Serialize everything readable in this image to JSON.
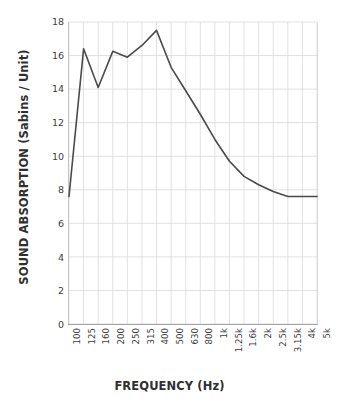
{
  "chart_data": {
    "type": "line",
    "title": "",
    "xlabel": "FREQUENCY (Hz)",
    "ylabel": "SOUND ABSORPTION (Sabins / Unit)",
    "categories": [
      "100",
      "125",
      "160",
      "200",
      "250",
      "315",
      "400",
      "500",
      "630",
      "800",
      "1k",
      "1.25k",
      "1.6k",
      "2k",
      "2.5k",
      "3.15k",
      "4k",
      "5k"
    ],
    "values": [
      7.6,
      16.4,
      14.1,
      16.25,
      15.9,
      16.6,
      17.5,
      15.3,
      13.9,
      12.5,
      11.0,
      9.7,
      8.8,
      8.3,
      7.9,
      7.6,
      7.6,
      7.6
    ],
    "series": [
      {
        "name": "Sound Absorption",
        "values": [
          7.6,
          16.4,
          14.1,
          16.25,
          15.9,
          16.6,
          17.5,
          15.3,
          13.9,
          12.5,
          11.0,
          9.7,
          8.8,
          8.3,
          7.9,
          7.6,
          7.6,
          7.6
        ]
      }
    ],
    "ylim": [
      0,
      18
    ],
    "yticks": [
      0,
      2,
      4,
      6,
      8,
      10,
      12,
      14,
      16,
      18
    ],
    "ytick_labels": [
      "0",
      "2",
      "4",
      "6",
      "8",
      "10",
      "12",
      "14",
      "16",
      "18"
    ],
    "grid": true,
    "grid_axis": "both",
    "legend": false,
    "legend_position": "none",
    "line_color": "#4a4a4a",
    "grid_color": "#d9d9d9",
    "axis_color": "#7f7f7f",
    "background_color": "#ffffff",
    "text_color": "#3d3d3d",
    "markers": false,
    "line_width": 1.6
  }
}
